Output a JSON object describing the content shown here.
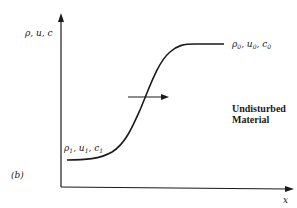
{
  "figure": {
    "panel_label": "(b)",
    "y_axis_label": "ρ, u, c",
    "x_axis_label": "x",
    "upstream_state": {
      "rho": "ρ",
      "u": "u",
      "c": "c",
      "subscript": "0",
      "separator": ", "
    },
    "downstream_state": {
      "rho": "ρ",
      "u": "u",
      "c": "c",
      "subscript": "1",
      "separator": ", "
    },
    "annotation": {
      "line1": "Undisturbed",
      "line2": "Material"
    },
    "arrow_direction": "right",
    "curve_description": "S-shaped transition from low state (ρ1,u1,c1) on left to high state (ρ0,u0,c0) on right",
    "colors": {
      "ink": "#1a1a1a",
      "background": "#ffffff"
    }
  }
}
